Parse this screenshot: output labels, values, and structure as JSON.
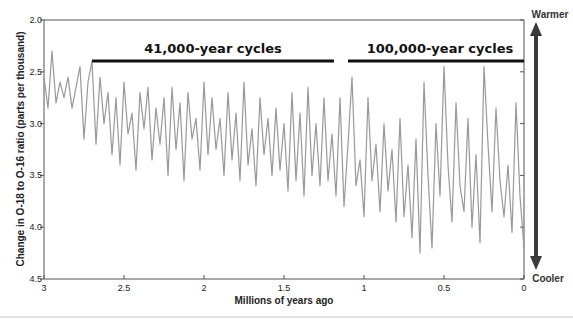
{
  "chart_data": {
    "type": "line",
    "title": "",
    "xlabel": "Millions of years ago",
    "ylabel": "Change in O-18 to O-16 ratio (parts per thousand)",
    "xlim": [
      3,
      0
    ],
    "ylim": [
      4.5,
      2.0
    ],
    "y_inverted": true,
    "x_inverted": true,
    "grid": false,
    "x_ticks": [
      "3",
      "2.5",
      "2",
      "1.5",
      "1",
      "0.5",
      "0"
    ],
    "x_tick_values": [
      3,
      2.5,
      2,
      1.5,
      1,
      0.5,
      0
    ],
    "y_ticks": [
      "2.0",
      "2.5",
      "3.0",
      "3.5",
      "4.0",
      "4.5"
    ],
    "y_tick_values": [
      2.0,
      2.5,
      3.0,
      3.5,
      4.0,
      4.5
    ],
    "series": [
      {
        "name": "Benthic δ18O",
        "color": "#999999",
        "x": [
          3.0,
          2.975,
          2.95,
          2.925,
          2.9,
          2.875,
          2.85,
          2.825,
          2.8,
          2.775,
          2.75,
          2.725,
          2.7,
          2.675,
          2.65,
          2.625,
          2.6,
          2.575,
          2.55,
          2.525,
          2.5,
          2.475,
          2.45,
          2.425,
          2.4,
          2.375,
          2.35,
          2.325,
          2.3,
          2.275,
          2.25,
          2.225,
          2.2,
          2.175,
          2.15,
          2.125,
          2.1,
          2.075,
          2.05,
          2.025,
          2.0,
          1.975,
          1.95,
          1.925,
          1.9,
          1.875,
          1.85,
          1.825,
          1.8,
          1.775,
          1.75,
          1.725,
          1.7,
          1.675,
          1.65,
          1.625,
          1.6,
          1.575,
          1.55,
          1.525,
          1.5,
          1.475,
          1.45,
          1.425,
          1.4,
          1.375,
          1.35,
          1.325,
          1.3,
          1.275,
          1.25,
          1.225,
          1.2,
          1.175,
          1.15,
          1.125,
          1.1,
          1.075,
          1.05,
          1.025,
          1.0,
          0.975,
          0.95,
          0.925,
          0.9,
          0.875,
          0.85,
          0.825,
          0.8,
          0.775,
          0.75,
          0.725,
          0.7,
          0.675,
          0.65,
          0.625,
          0.6,
          0.575,
          0.55,
          0.525,
          0.5,
          0.475,
          0.45,
          0.425,
          0.4,
          0.375,
          0.35,
          0.325,
          0.3,
          0.275,
          0.25,
          0.225,
          0.2,
          0.175,
          0.15,
          0.125,
          0.1,
          0.075,
          0.05,
          0.025,
          0.0
        ],
        "values": [
          2.55,
          2.85,
          2.3,
          2.8,
          2.6,
          2.75,
          2.55,
          2.85,
          2.65,
          2.45,
          3.15,
          2.6,
          2.4,
          3.2,
          2.55,
          3.0,
          2.7,
          3.3,
          2.75,
          3.4,
          2.6,
          3.1,
          2.9,
          3.45,
          2.7,
          3.05,
          2.65,
          3.35,
          2.85,
          3.2,
          2.75,
          3.5,
          2.65,
          3.25,
          2.8,
          3.55,
          2.7,
          3.15,
          2.95,
          3.45,
          2.6,
          3.3,
          2.75,
          3.25,
          2.95,
          3.5,
          2.7,
          3.35,
          2.9,
          3.55,
          2.6,
          3.4,
          3.05,
          3.6,
          2.75,
          3.3,
          2.95,
          3.5,
          2.85,
          3.45,
          3.0,
          3.65,
          2.7,
          3.55,
          2.9,
          3.7,
          2.65,
          3.5,
          3.0,
          3.6,
          2.75,
          3.55,
          3.1,
          3.7,
          2.75,
          3.8,
          3.2,
          2.55,
          3.6,
          3.35,
          3.9,
          2.75,
          3.55,
          3.2,
          3.85,
          3.0,
          3.65,
          3.25,
          3.95,
          2.95,
          3.9,
          3.4,
          4.1,
          3.15,
          4.25,
          2.6,
          3.5,
          4.2,
          3.0,
          3.7,
          2.45,
          3.4,
          3.95,
          2.8,
          3.6,
          3.85,
          2.95,
          4.0,
          3.3,
          4.15,
          2.45,
          3.2,
          3.85,
          2.85,
          3.55,
          3.9,
          3.4,
          4.05,
          2.8,
          3.7,
          4.2
        ]
      }
    ],
    "annotations": [
      {
        "text": "41,000-year cycles",
        "x_range": [
          2.7,
          1.2
        ],
        "y": 2.4
      },
      {
        "text": "100,000-year cycles",
        "x_range": [
          1.12,
          0.0
        ],
        "y": 2.4
      }
    ],
    "side_arrow": {
      "top_label": "Warmer",
      "bottom_label": "Cooler",
      "color": "#3a3a3a"
    }
  },
  "labels": {
    "x_axis_title": "Millions of years ago",
    "y_axis_title": "Change in O-18 to O-16 ratio (parts per thousand)",
    "cycle_41k": "41,000-year cycles",
    "cycle_100k": "100,000-year cycles",
    "warmer": "Warmer",
    "cooler": "Cooler",
    "x_ticks": [
      "3",
      "2.5",
      "2",
      "1.5",
      "1",
      "0.5",
      "0"
    ],
    "y_ticks": [
      "2.0",
      "2.5",
      "3.0",
      "3.5",
      "4.0",
      "4.5"
    ]
  }
}
